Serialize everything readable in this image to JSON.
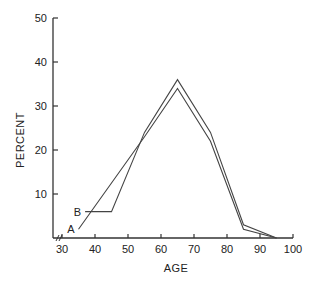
{
  "chart_data": {
    "type": "line",
    "title": "",
    "xlabel": "AGE",
    "ylabel": "PERCENT",
    "xlim": [
      30,
      100
    ],
    "ylim": [
      0,
      50
    ],
    "x_ticks": [
      "30",
      "40",
      "50",
      "60",
      "70",
      "80",
      "90",
      "100"
    ],
    "y_ticks": [
      "10",
      "20",
      "30",
      "40",
      "50"
    ],
    "grid": false,
    "legend": "inline labels at line starts",
    "axis_break": "x-axis break between origin and 30",
    "series": [
      {
        "name": "A",
        "x": [
          35,
          55,
          65,
          75,
          85,
          95
        ],
        "values": [
          2,
          23,
          34,
          22,
          2,
          0
        ]
      },
      {
        "name": "B",
        "x": [
          37,
          45,
          55,
          65,
          75,
          85,
          95
        ],
        "values": [
          6,
          6,
          24,
          36,
          24,
          3,
          0
        ]
      }
    ]
  }
}
